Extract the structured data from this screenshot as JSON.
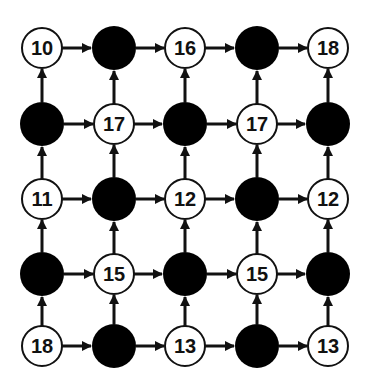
{
  "diagram": {
    "type": "grid-graph",
    "rows": 5,
    "cols": 5,
    "colors": {
      "background": "#ffffff",
      "filled_node": "#000000",
      "open_node_fill": "#ffffff",
      "stroke": "#111111",
      "arrow": "#111111",
      "label": "#111111"
    },
    "col_x": [
      42,
      114,
      185,
      257,
      328
    ],
    "row_y": [
      48,
      124,
      199,
      274,
      346
    ],
    "nodes": [
      [
        {
          "type": "open",
          "label": "10"
        },
        {
          "type": "filled",
          "label": ""
        },
        {
          "type": "open",
          "label": "16"
        },
        {
          "type": "filled",
          "label": ""
        },
        {
          "type": "open",
          "label": "18"
        }
      ],
      [
        {
          "type": "filled",
          "label": ""
        },
        {
          "type": "open",
          "label": "17"
        },
        {
          "type": "filled",
          "label": ""
        },
        {
          "type": "open",
          "label": "17"
        },
        {
          "type": "filled",
          "label": ""
        }
      ],
      [
        {
          "type": "open",
          "label": "11"
        },
        {
          "type": "filled",
          "label": ""
        },
        {
          "type": "open",
          "label": "12"
        },
        {
          "type": "filled",
          "label": ""
        },
        {
          "type": "open",
          "label": "12"
        }
      ],
      [
        {
          "type": "filled",
          "label": ""
        },
        {
          "type": "open",
          "label": "15"
        },
        {
          "type": "filled",
          "label": ""
        },
        {
          "type": "open",
          "label": "15"
        },
        {
          "type": "filled",
          "label": ""
        }
      ],
      [
        {
          "type": "open",
          "label": "18"
        },
        {
          "type": "filled",
          "label": ""
        },
        {
          "type": "open",
          "label": "13"
        },
        {
          "type": "filled",
          "label": ""
        },
        {
          "type": "open",
          "label": "13"
        }
      ]
    ],
    "edges": {
      "horizontal": "every node points right to its neighbor",
      "vertical": "every node points up to its neighbor"
    }
  }
}
